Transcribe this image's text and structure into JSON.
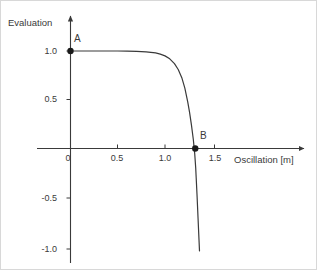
{
  "chart_data": {
    "type": "line",
    "title": "",
    "xlabel": "Oscillation [m]",
    "ylabel": "Evaluation",
    "xlim": [
      -0.12,
      1.72
    ],
    "ylim": [
      -1.12,
      1.12
    ],
    "grid": false,
    "legend": "none",
    "xticks": [
      {
        "value": 0,
        "label": "0"
      },
      {
        "value": 0.5,
        "label": "0.5"
      },
      {
        "value": 1.0,
        "label": "1.0"
      },
      {
        "value": 1.5,
        "label": "1.5"
      }
    ],
    "yticks": [
      {
        "value": 1.0,
        "label": "1.0"
      },
      {
        "value": 0.5,
        "label": "0.5"
      },
      {
        "value": -0.5,
        "label": "-0.5"
      },
      {
        "value": -1.0,
        "label": "-1.0"
      }
    ],
    "series": [
      {
        "name": "evaluation-curve",
        "color": "#3a3a3a",
        "x": [
          0.0,
          0.1,
          0.2,
          0.3,
          0.4,
          0.5,
          0.6,
          0.7,
          0.8,
          0.9,
          0.95,
          1.0,
          1.05,
          1.1,
          1.14,
          1.18,
          1.21,
          1.24,
          1.26,
          1.28,
          1.3,
          1.315,
          1.325,
          1.33,
          1.34,
          1.35,
          1.36,
          1.365
        ],
        "y": [
          1.0,
          1.0,
          1.0,
          1.0,
          1.0,
          1.0,
          0.999,
          0.997,
          0.992,
          0.98,
          0.968,
          0.95,
          0.92,
          0.87,
          0.81,
          0.72,
          0.62,
          0.48,
          0.37,
          0.24,
          0.09,
          -0.06,
          -0.2,
          -0.3,
          -0.5,
          -0.72,
          -0.94,
          -1.05
        ]
      }
    ],
    "points": [
      {
        "name": "A",
        "label": "A",
        "x": 0.0,
        "y": 1.0
      },
      {
        "name": "B",
        "label": "B",
        "x": 1.32,
        "y": 0.0
      }
    ],
    "annotations": [
      "A",
      "B"
    ],
    "axis_color": "#3a3a3a",
    "curve_color": "#3a3a3a",
    "background_color": "#ffffff"
  }
}
